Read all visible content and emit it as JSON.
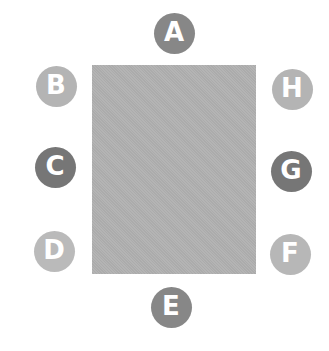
{
  "diagram": {
    "center_rect": {
      "color": "#b1b1b1"
    },
    "badges": [
      {
        "label": "A",
        "cx": 174,
        "cy": 33,
        "color": "#878787"
      },
      {
        "label": "B",
        "cx": 56,
        "cy": 86,
        "color": "#b4b4b4"
      },
      {
        "label": "C",
        "cx": 55,
        "cy": 167,
        "color": "#767676"
      },
      {
        "label": "D",
        "cx": 54,
        "cy": 251,
        "color": "#bababa"
      },
      {
        "label": "E",
        "cx": 171,
        "cy": 307,
        "color": "#878787"
      },
      {
        "label": "F",
        "cx": 290,
        "cy": 254,
        "color": "#b7b7b7"
      },
      {
        "label": "G",
        "cx": 291,
        "cy": 171,
        "color": "#767676"
      },
      {
        "label": "H",
        "cx": 292,
        "cy": 89,
        "color": "#b4b4b4"
      }
    ]
  }
}
